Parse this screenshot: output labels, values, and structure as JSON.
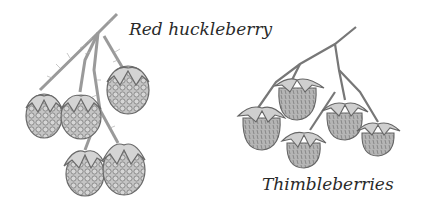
{
  "figure": {
    "labels": {
      "red_huckleberry": "Red huckleberry",
      "thimbleberries": "Thimbleberries"
    },
    "illustrations": [
      {
        "name": "red-huckleberry-sprig",
        "berry_count": 5,
        "style": "pencil sketch, hairy stems, drupelet clusters"
      },
      {
        "name": "thimbleberry-sprig",
        "berry_count": 5,
        "style": "pencil sketch, smooth stems, textured berries"
      }
    ],
    "colors": {
      "background": "#ffffff",
      "stroke": "#5a5a5a",
      "berry_fill": "#bdbdbd",
      "sepal_fill": "#d9d9d9",
      "text": "#2a2a2a"
    }
  }
}
